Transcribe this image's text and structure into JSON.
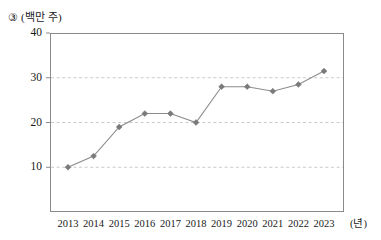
{
  "figure": {
    "item_marker": "③",
    "unit_caption": "(백만 주)",
    "x_unit_label": "(년)"
  },
  "style": {
    "line_color": "#8c8c8c",
    "marker_color": "#7a7a7a",
    "grid_color": "#bdbdbd",
    "frame_color": "#8a8a8a",
    "text_color": "#1a1a1a"
  },
  "chart_data": {
    "type": "line",
    "xlabel": "(년)",
    "ylabel": "(백만 주)",
    "categories": [
      "2013",
      "2014",
      "2015",
      "2016",
      "2017",
      "2018",
      "2019",
      "2020",
      "2021",
      "2022",
      "2023"
    ],
    "values": [
      10,
      12.5,
      19,
      22,
      22,
      20,
      28,
      28,
      27,
      28.5,
      31.5
    ],
    "series": [
      {
        "name": "주식 수",
        "values": [
          10,
          12.5,
          19,
          22,
          22,
          20,
          28,
          28,
          27,
          28.5,
          31.5
        ]
      }
    ],
    "ylim": [
      0,
      40
    ],
    "yticks": [
      10,
      20,
      30,
      40
    ],
    "ytick_labels": [
      "10",
      "20",
      "30",
      "40"
    ],
    "grid": true,
    "grid_axis": "y",
    "grid_style": "dashed",
    "gridlines_at": [
      10,
      20,
      30
    ],
    "legend": false,
    "marker": "diamond"
  }
}
